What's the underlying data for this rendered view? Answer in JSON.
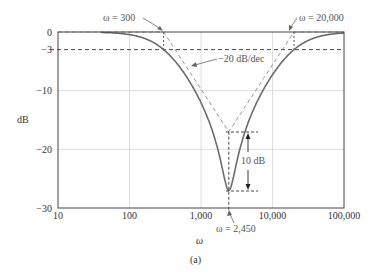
{
  "chart_data": {
    "type": "line",
    "title": "",
    "caption": "(a)",
    "xlabel": "ω",
    "ylabel": "dB",
    "xscale": "log",
    "xlim": [
      10,
      100000
    ],
    "ylim": [
      -30,
      0
    ],
    "grid": true,
    "x_ticks": [
      10,
      100,
      1000,
      10000,
      100000
    ],
    "x_tick_labels": [
      "10",
      "100",
      "1,000",
      "10,000",
      "100,000"
    ],
    "y_ticks": [
      0,
      -3,
      -10,
      -20,
      -30
    ],
    "y_tick_labels": [
      "0",
      "−3",
      "−10",
      "−20",
      "−30"
    ],
    "series": [
      {
        "name": "Notch filter magnitude response",
        "style": "solid",
        "x": [
          10,
          50,
          100,
          150,
          200,
          300,
          500,
          700,
          1000,
          1500,
          2000,
          2450,
          3000,
          4000,
          6000,
          8000,
          10000,
          15000,
          20000,
          30000,
          50000,
          100000
        ],
        "y": [
          0,
          0,
          -0.1,
          -0.3,
          -0.8,
          -3,
          -6.5,
          -9.2,
          -12.8,
          -18.3,
          -23.8,
          -27,
          -23.8,
          -19,
          -13.8,
          -10.5,
          -8.3,
          -4.6,
          -3,
          -1.3,
          -0.5,
          -0.1
        ]
      },
      {
        "name": "Bode asymptote",
        "style": "dashed",
        "x": [
          10,
          300,
          2450,
          20000,
          100000
        ],
        "y": [
          0,
          0,
          -17,
          0,
          0
        ]
      }
    ],
    "reference_lines": [
      {
        "label": "−3 dB level",
        "y": -3,
        "style": "dashed"
      },
      {
        "label": "ω = 2,450 center",
        "x": 2450,
        "style": "dashed"
      }
    ],
    "annotations": [
      {
        "text": "ω = 300",
        "points_to": {
          "x": 300,
          "y": 0
        }
      },
      {
        "text": "ω = 20,000",
        "points_to": {
          "x": 20000,
          "y": 0
        }
      },
      {
        "text": "−20 dB/dec",
        "points_to": "asymptote slope"
      },
      {
        "text": "ω = 2,450",
        "points_to": {
          "x": 2450,
          "y": -30
        }
      },
      {
        "text": "10 dB",
        "between": [
          -17,
          -27
        ]
      }
    ]
  },
  "labels": {
    "w300": "ω = 300",
    "w20000": "ω = 20,000",
    "slope": "−20 dB/dec",
    "w2450": "ω = 2,450",
    "ten_db": "10 dB",
    "ylabel": "dB",
    "xlabel": "ω",
    "caption": "(a)"
  },
  "colors": {
    "curve": "#6b6b6b",
    "asymptote": "#8a8a8a",
    "axis": "#444444",
    "grid": "#d6d6d6",
    "dash": "#333333",
    "annotation": "#666666"
  }
}
